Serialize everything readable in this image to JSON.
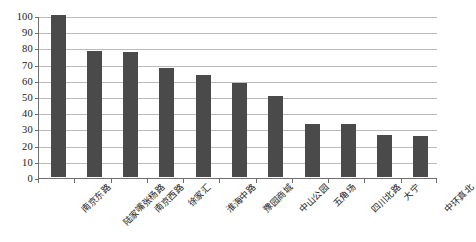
{
  "chart_data": {
    "type": "bar",
    "title": "",
    "subtitle": "",
    "xlabel": "",
    "ylabel": "",
    "ylim": [
      0,
      100
    ],
    "ytick_step": 10,
    "grid": true,
    "legend": false,
    "legend_position": "none",
    "bar_color": "#4a4a4a",
    "axis_color": "#6f6f6f",
    "gridline_color": "#bcbcbc",
    "background_color": "#ffffff",
    "label_rotation": -45,
    "categories": [
      "南京东路",
      "陆家嘴张杨路",
      "南京西路",
      "徐家汇",
      "淮海中路",
      "豫园商城",
      "中山公园",
      "五角场",
      "四川北路",
      "大宁",
      "中环真北"
    ],
    "values": [
      100,
      78,
      77,
      67,
      63,
      58,
      50,
      33,
      33,
      26,
      25
    ],
    "ytick_labels": [
      "0",
      "10",
      "20",
      "30",
      "40",
      "50",
      "60",
      "70",
      "80",
      "90",
      "100"
    ],
    "ytick_values": [
      0,
      10,
      20,
      30,
      40,
      50,
      60,
      70,
      80,
      90,
      100
    ]
  }
}
